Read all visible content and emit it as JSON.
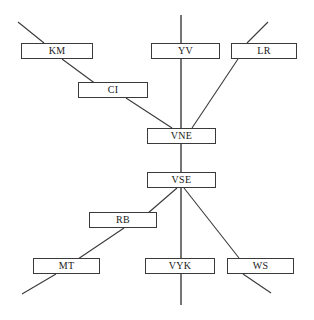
{
  "diagram": {
    "canvas": {
      "width": 314,
      "height": 320,
      "background": "#ffffff"
    },
    "style": {
      "node_fill": "#ffffff",
      "node_border": "#3a3a3a",
      "edge_color": "#3a3a3a",
      "label_color": "#1a1a1a"
    },
    "nodes": [
      {
        "id": "KM",
        "label": "KM",
        "x": 21,
        "y": 43,
        "w": 72,
        "h": 16
      },
      {
        "id": "CI",
        "label": "CI",
        "x": 78,
        "y": 82,
        "w": 70,
        "h": 16
      },
      {
        "id": "YV",
        "label": "YV",
        "x": 151,
        "y": 43,
        "w": 69,
        "h": 16
      },
      {
        "id": "LR",
        "label": "LR",
        "x": 231,
        "y": 43,
        "w": 66,
        "h": 16
      },
      {
        "id": "VNE",
        "label": "VNE",
        "x": 147,
        "y": 128,
        "w": 69,
        "h": 16
      },
      {
        "id": "VSE",
        "label": "VSE",
        "x": 147,
        "y": 172,
        "w": 69,
        "h": 16
      },
      {
        "id": "RB",
        "label": "RB",
        "x": 89,
        "y": 212,
        "w": 68,
        "h": 16
      },
      {
        "id": "MT",
        "label": "MT",
        "x": 33,
        "y": 258,
        "w": 67,
        "h": 16
      },
      {
        "id": "VYK",
        "label": "VYK",
        "x": 145,
        "y": 258,
        "w": 70,
        "h": 16
      },
      {
        "id": "WS",
        "label": "WS",
        "x": 227,
        "y": 258,
        "w": 67,
        "h": 16
      }
    ],
    "edges": [
      {
        "id": "spine",
        "kind": "vertical",
        "x1": 181,
        "y1": 15,
        "x2": 181,
        "y2": 305
      },
      {
        "id": "km-stub",
        "kind": "diagonal",
        "x1": 18,
        "y1": 22,
        "x2": 44,
        "y2": 43
      },
      {
        "id": "km-ci",
        "kind": "diagonal",
        "x1": 62,
        "y1": 59,
        "x2": 104,
        "y2": 90
      },
      {
        "id": "ci-vne",
        "kind": "diagonal",
        "x1": 126,
        "y1": 98,
        "x2": 172,
        "y2": 128
      },
      {
        "id": "lr-stub",
        "kind": "diagonal",
        "x1": 268,
        "y1": 22,
        "x2": 247,
        "y2": 43
      },
      {
        "id": "lr-vne",
        "kind": "diagonal",
        "x1": 238,
        "y1": 59,
        "x2": 192,
        "y2": 128
      },
      {
        "id": "vse-rb",
        "kind": "diagonal",
        "x1": 177,
        "y1": 188,
        "x2": 140,
        "y2": 220
      },
      {
        "id": "rb-mt",
        "kind": "diagonal",
        "x1": 124,
        "y1": 228,
        "x2": 78,
        "y2": 259
      },
      {
        "id": "mt-stub",
        "kind": "diagonal",
        "x1": 56,
        "y1": 274,
        "x2": 22,
        "y2": 294
      },
      {
        "id": "vse-ws",
        "kind": "diagonal",
        "x1": 184,
        "y1": 188,
        "x2": 239,
        "y2": 258
      },
      {
        "id": "ws-stub",
        "kind": "diagonal",
        "x1": 243,
        "y1": 274,
        "x2": 271,
        "y2": 293
      }
    ]
  }
}
